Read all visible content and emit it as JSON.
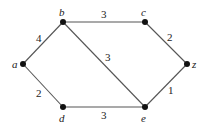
{
  "graph": {
    "nodes": [
      {
        "id": "a",
        "label": "a",
        "x": 23,
        "y": 64
      },
      {
        "id": "b",
        "label": "b",
        "x": 63,
        "y": 22
      },
      {
        "id": "c",
        "label": "c",
        "x": 145,
        "y": 22
      },
      {
        "id": "z",
        "label": "z",
        "x": 187,
        "y": 64
      },
      {
        "id": "d",
        "label": "d",
        "x": 63,
        "y": 107
      },
      {
        "id": "e",
        "label": "e",
        "x": 145,
        "y": 107
      }
    ],
    "edges": [
      {
        "from": "a",
        "to": "b",
        "weight": "4"
      },
      {
        "from": "a",
        "to": "d",
        "weight": "2"
      },
      {
        "from": "b",
        "to": "c",
        "weight": "3"
      },
      {
        "from": "b",
        "to": "e",
        "weight": "3"
      },
      {
        "from": "d",
        "to": "e",
        "weight": "3"
      },
      {
        "from": "c",
        "to": "z",
        "weight": "2"
      },
      {
        "from": "e",
        "to": "z",
        "weight": "1"
      }
    ],
    "colors": {
      "edge": "#555555",
      "node": "#111111"
    }
  }
}
